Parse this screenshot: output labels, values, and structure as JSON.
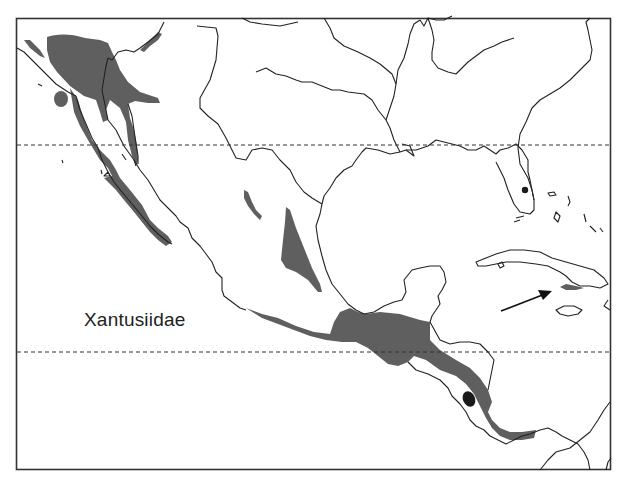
{
  "map": {
    "title": "Xantusiidae",
    "colors": {
      "range_fill": "#5f5f5f",
      "dark_spot": "#1a1a1a",
      "coastline": "#222222",
      "background": "#ffffff",
      "frame": "#333333"
    },
    "latitude_lines": [
      {
        "y": 145,
        "style": "dashed"
      },
      {
        "y": 352,
        "style": "dashed"
      }
    ],
    "annotations": [
      {
        "type": "arrow",
        "pointing_to": "southern Cuba range spot"
      }
    ],
    "regions_shown": [
      "Baja California",
      "Mexico",
      "Southeastern United States",
      "Florida",
      "Gulf of Mexico",
      "Cuba",
      "Jamaica",
      "Central America",
      "Caribbean"
    ]
  }
}
